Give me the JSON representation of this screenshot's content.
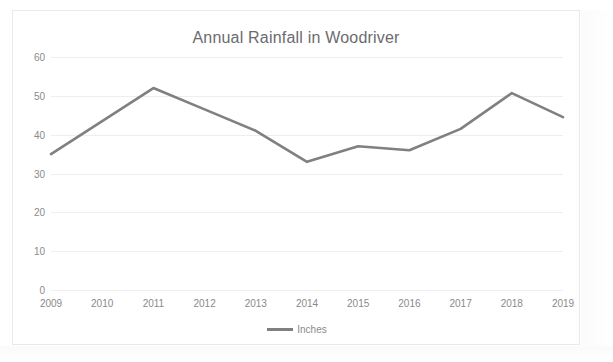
{
  "page": {
    "scan_artifact_text": " "
  },
  "chart_data": {
    "type": "line",
    "title": "Annual Rainfall in Woodriver",
    "xlabel": "",
    "ylabel": "",
    "categories": [
      "2009",
      "2010",
      "2011",
      "2012",
      "2013",
      "2014",
      "2015",
      "2016",
      "2017",
      "2018",
      "2019"
    ],
    "series": [
      {
        "name": "Inches",
        "color": "#808083",
        "values": [
          35,
          43.5,
          52,
          46.5,
          41,
          33,
          37,
          36,
          41.5,
          50.7,
          44.5
        ]
      }
    ],
    "ylim": [
      0,
      60
    ],
    "yticks": [
      0,
      10,
      20,
      30,
      40,
      50,
      60
    ],
    "ytick_labels": [
      "0",
      "10",
      "20",
      "30",
      "40",
      "50",
      "60"
    ],
    "grid": true,
    "legend": {
      "position": "bottom",
      "entries": [
        {
          "label": "Inches",
          "color": "#808083"
        }
      ]
    },
    "line_color": "#808083",
    "grid_color": "#eeeef0",
    "text_color": "#8a8a8d",
    "title_color": "#6b6b6e",
    "background": "#ffffff"
  }
}
